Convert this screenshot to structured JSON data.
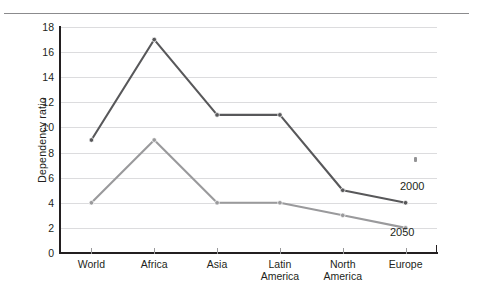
{
  "chart_data": {
    "type": "line",
    "title": "",
    "subtitle": "",
    "xlabel": "",
    "ylabel": "Dependency ratio",
    "categories": [
      "World",
      "Africa",
      "Asia",
      "Latin America",
      "North America",
      "Europe"
    ],
    "category_lines": [
      [
        "World"
      ],
      [
        "Africa"
      ],
      [
        "Asia"
      ],
      [
        "Latin",
        "America"
      ],
      [
        "North",
        "America"
      ],
      [
        "Europe"
      ]
    ],
    "series": [
      {
        "name": "2000",
        "values": [
          9,
          17,
          11,
          11,
          5,
          4
        ],
        "color": "#58585a"
      },
      {
        "name": "2050",
        "values": [
          4,
          9,
          4,
          4,
          3,
          2
        ],
        "color": "#9a9a9c"
      }
    ],
    "ylim": [
      0,
      18
    ],
    "ytick_step": 2,
    "yticks": [
      0,
      2,
      4,
      6,
      8,
      10,
      12,
      14,
      16,
      18
    ],
    "ytick_labels": [
      "0",
      "2",
      "4",
      "6",
      "8",
      "10",
      "12",
      "14",
      "16",
      "18"
    ],
    "grid": true,
    "grid_axis": "y",
    "grid_color": "#dcdcde",
    "legend_position": "inline-end-labels",
    "markers": true,
    "annotations": [
      {
        "text": "2000",
        "series": "2000",
        "position": "right-of-last-point"
      },
      {
        "text": "2050",
        "series": "2050",
        "position": "below-last-point"
      }
    ]
  },
  "figure": {
    "background_color": "#ffffff",
    "axis_color": "#231f20",
    "text_color": "#231f20",
    "top_rule_color": "#8b8b8d"
  }
}
